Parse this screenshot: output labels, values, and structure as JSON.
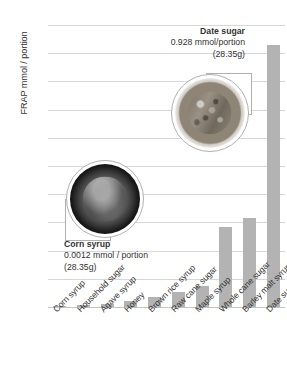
{
  "chart_data": {
    "type": "bar",
    "title": "",
    "xlabel": "",
    "ylabel": "FRAP mmol / portion",
    "ylim": [
      0,
      1
    ],
    "ytick_step": 0.1,
    "grid": true,
    "legend": "none",
    "bar_color": "#b3b3b3",
    "categories": [
      "Corn syrup",
      "Household sugar",
      "Agave syrup",
      "Honey",
      "Brown rice syrup",
      "Raw cane sugar",
      "Maple syrup",
      "Whole cane sugar",
      "Barley malt syrup",
      "Date sugar"
    ],
    "values": [
      0.0012,
      0.007,
      0.009,
      0.022,
      0.036,
      0.055,
      0.073,
      0.285,
      0.315,
      0.928
    ],
    "ytick_labels": [
      "0",
      "0.1",
      "0.2",
      "0.3",
      "0.4",
      "0.5",
      "0.6",
      "0.7",
      "0.8",
      "0.9",
      "1"
    ],
    "annotations": [
      {
        "name": "date-sugar",
        "title": "Date sugar",
        "value_line": "0.928 mmol/portion",
        "portion_line": "(28.35g)",
        "photo": "bowl-of-date-sugar"
      },
      {
        "name": "corn-syrup",
        "title": "Corn syrup",
        "value_line": "0.0012 mmol / portion",
        "portion_line": "(28.35g)",
        "photo": "bowl-of-corn-syrup"
      }
    ]
  }
}
